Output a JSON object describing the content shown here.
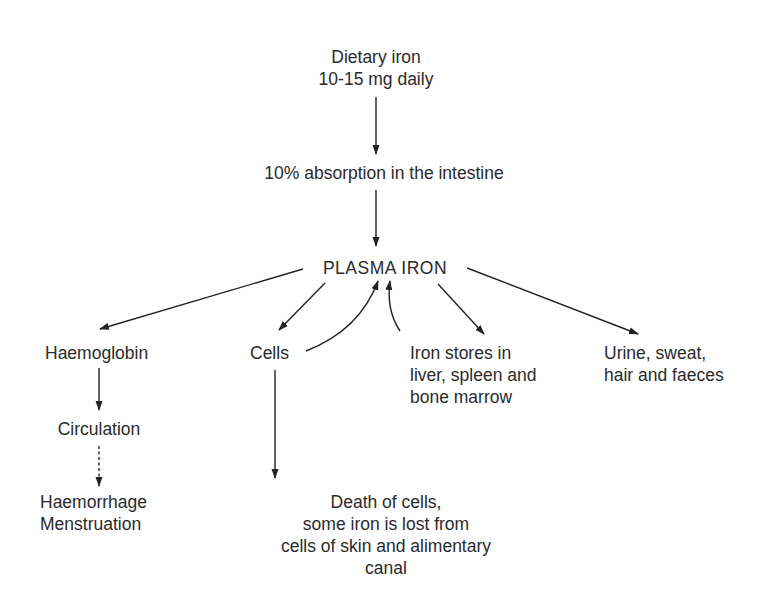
{
  "diagram": {
    "nodes": {
      "dietary": {
        "lines": [
          "Dietary iron",
          "10-15 mg daily"
        ]
      },
      "absorption": {
        "lines": [
          "10% absorption in the intestine"
        ]
      },
      "plasma": {
        "lines": [
          "PLASMA IRON"
        ]
      },
      "haemoglobin": {
        "lines": [
          "Haemoglobin"
        ]
      },
      "cells": {
        "lines": [
          "Cells"
        ]
      },
      "stores": {
        "lines": [
          "Iron stores in",
          "liver, spleen and",
          "bone marrow"
        ]
      },
      "excretion": {
        "lines": [
          "Urine, sweat,",
          "hair and faeces"
        ]
      },
      "circulation": {
        "lines": [
          "Circulation"
        ]
      },
      "loss": {
        "lines": [
          "Haemorrhage",
          "Menstruation"
        ]
      },
      "death": {
        "lines": [
          "Death of cells,",
          "some iron is lost from",
          "cells of skin and alimentary",
          "canal"
        ]
      }
    },
    "edges": [
      {
        "from": "dietary",
        "to": "absorption",
        "style": "solid"
      },
      {
        "from": "absorption",
        "to": "plasma",
        "style": "solid"
      },
      {
        "from": "plasma",
        "to": "haemoglobin",
        "style": "solid"
      },
      {
        "from": "plasma",
        "to": "cells",
        "style": "solid"
      },
      {
        "from": "cells",
        "to": "plasma",
        "style": "solid-curved"
      },
      {
        "from": "stores",
        "to": "plasma",
        "style": "solid-curved"
      },
      {
        "from": "plasma",
        "to": "stores",
        "style": "solid"
      },
      {
        "from": "plasma",
        "to": "excretion",
        "style": "solid"
      },
      {
        "from": "haemoglobin",
        "to": "circulation",
        "style": "solid"
      },
      {
        "from": "circulation",
        "to": "loss",
        "style": "dashed"
      },
      {
        "from": "cells",
        "to": "death",
        "style": "solid"
      }
    ],
    "colors": {
      "text": "#2b2b2b",
      "line": "#222222",
      "background": "#fefefe"
    }
  }
}
